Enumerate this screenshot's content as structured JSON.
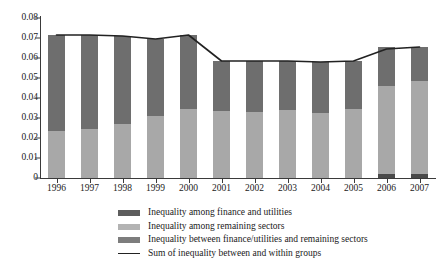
{
  "chart_data": {
    "type": "bar",
    "title": "",
    "subtitle": "",
    "xlabel": "",
    "ylabel": "",
    "ylim": [
      0,
      0.08
    ],
    "ytick_labels": [
      "0.08",
      "0.07",
      "0.06",
      "0.05",
      "0.04",
      "0.03",
      "0.02",
      "0.01",
      "0"
    ],
    "ytick_values": [
      0.08,
      0.07,
      0.06,
      0.05,
      0.04,
      0.03,
      0.02,
      0.01,
      0
    ],
    "grid": false,
    "stacked": true,
    "legend_position": "bottom",
    "categories": [
      "1996",
      "1997",
      "1998",
      "1999",
      "2000",
      "2001",
      "2002",
      "2003",
      "2004",
      "2005",
      "2006",
      "2007"
    ],
    "series": [
      {
        "name": "Inequality between finance/utilities and remaining sectors",
        "color": "#4a4a4a",
        "values": [
          0.0,
          0.0,
          0.0,
          0.0,
          0.0,
          0.0,
          0.0,
          0.0,
          0.0,
          0.0,
          0.002,
          0.002
        ]
      },
      {
        "name": "Inequality among remaining sectors",
        "color": "#a8a8a8",
        "values": [
          0.0235,
          0.0245,
          0.027,
          0.031,
          0.0345,
          0.0335,
          0.033,
          0.034,
          0.0325,
          0.0345,
          0.044,
          0.0465
        ]
      },
      {
        "name": "Inequality among finance and utilities",
        "color": "#6e6e6e",
        "values": [
          0.048,
          0.047,
          0.044,
          0.0385,
          0.037,
          0.025,
          0.0255,
          0.0245,
          0.0255,
          0.024,
          0.0195,
          0.017
        ]
      }
    ],
    "line_series": {
      "name": "Sum of inequality between and within groups",
      "color": "#222222",
      "values": [
        0.0715,
        0.0715,
        0.071,
        0.0695,
        0.0715,
        0.0585,
        0.0585,
        0.0585,
        0.058,
        0.0585,
        0.0645,
        0.0655
      ]
    },
    "legend": [
      {
        "label": "Inequality among finance and utilities",
        "swatch": "dark-gray-swatch",
        "color": "#5d5d5d",
        "type": "box"
      },
      {
        "label": "Inequality among remaining sectors",
        "swatch": "light-gray-swatch",
        "color": "#b3b3b3",
        "type": "box"
      },
      {
        "label": "Inequality between finance/utilities and remaining sectors",
        "swatch": "medium-gray-swatch",
        "color": "#7d7d7d",
        "type": "box"
      },
      {
        "label": "Sum of inequality between and within groups",
        "swatch": "line-swatch",
        "color": "#222222",
        "type": "line"
      }
    ]
  }
}
